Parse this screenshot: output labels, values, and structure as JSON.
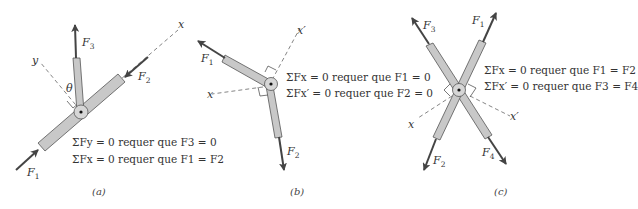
{
  "panels": [
    {
      "caption": "(a)",
      "equations": [
        "ΣFy = 0 requer que F3 = 0",
        "ΣFx = 0 requer que F1 = F2"
      ],
      "labels": {
        "axis1": "x",
        "axis2": "y",
        "angle": "θ",
        "forces": [
          "F1",
          "F2",
          "F3"
        ]
      }
    },
    {
      "caption": "(b)",
      "equations": [
        "ΣFx = 0 requer que F1 = 0",
        "ΣFx′ = 0 requer que F2 = 0"
      ],
      "labels": {
        "axis1": "x",
        "axis2": "x′",
        "forces": [
          "F1",
          "F2"
        ]
      }
    },
    {
      "caption": "(c)",
      "equations": [
        "ΣFx = 0 requer que F1 = F2",
        "ΣFx′ = 0 requer que F3 = F4"
      ],
      "labels": {
        "axis1": "x",
        "axis2": "x′",
        "forces": [
          "F1",
          "F2",
          "F3",
          "F4"
        ]
      }
    }
  ],
  "colors": {
    "member_fill": "#c8c8c8",
    "member_stroke": "#555555",
    "arrow": "#444444",
    "dashed": "#666666"
  }
}
